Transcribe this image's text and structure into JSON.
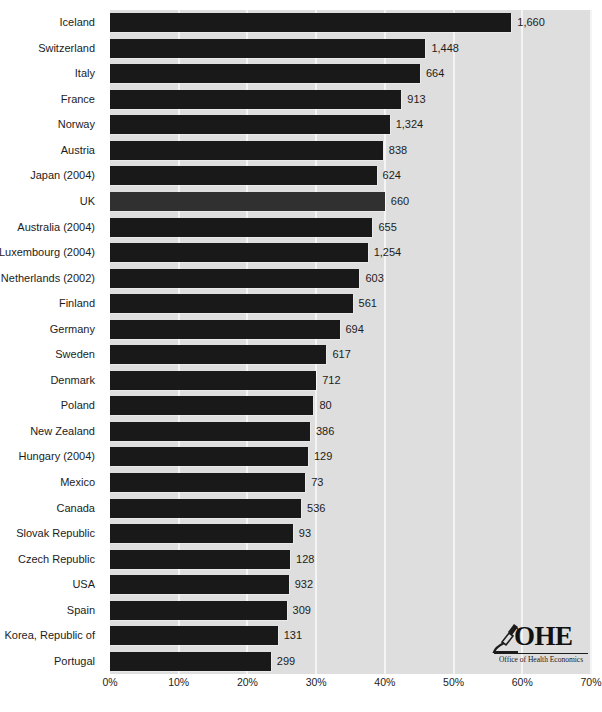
{
  "chart_data": {
    "type": "bar",
    "orientation": "horizontal",
    "title": "",
    "subtitle": "",
    "xlabel": "",
    "ylabel": "",
    "xlim": [
      0,
      70
    ],
    "xtick_labels": [
      "0%",
      "10%",
      "20%",
      "30%",
      "40%",
      "50%",
      "60%",
      "70%"
    ],
    "xtick_values": [
      0,
      10,
      20,
      30,
      40,
      50,
      60,
      70
    ],
    "grid": true,
    "legend": null,
    "value_label_suffix": "",
    "highlight_category": "UK",
    "categories": [
      "Iceland",
      "Switzerland",
      "Italy",
      "France",
      "Norway",
      "Austria",
      "Japan (2004)",
      "UK",
      "Australia (2004)",
      "Luxembourg (2004)",
      "Netherlands (2002)",
      "Finland",
      "Germany",
      "Sweden",
      "Denmark",
      "Poland",
      "New Zealand",
      "Hungary (2004)",
      "Mexico",
      "Canada",
      "Slovak Republic",
      "Czech Republic",
      "USA",
      "Spain",
      "Korea, Republic of",
      "Portugal"
    ],
    "values": [
      58.4,
      45.9,
      45.1,
      42.4,
      40.7,
      39.7,
      38.8,
      40.0,
      38.2,
      37.5,
      36.3,
      35.3,
      33.4,
      31.5,
      30.0,
      29.6,
      29.1,
      28.8,
      28.4,
      27.8,
      26.6,
      26.2,
      26.0,
      25.7,
      24.4,
      23.4
    ],
    "point_labels": [
      "1,660",
      "1,448",
      "664",
      "913",
      "1,324",
      "838",
      "624",
      "660",
      "655",
      "1,254",
      "603",
      "561",
      "694",
      "617",
      "712",
      "80",
      "386",
      "129",
      "73",
      "536",
      "93",
      "128",
      "932",
      "309",
      "131",
      "299"
    ]
  },
  "logo": {
    "name": "OHE",
    "subtitle": "Office of Health Economics"
  },
  "colors": {
    "bar": "#191919",
    "bar_highlight": "#303030",
    "plot_background": "#dedede",
    "gridline": "#f4f4f4",
    "text": "#1c1c1c"
  }
}
